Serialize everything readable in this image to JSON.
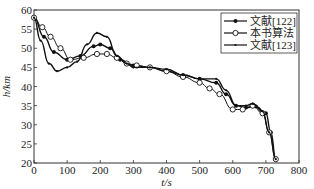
{
  "chart_data": {
    "type": "line",
    "title": "",
    "xlabel": "t/s",
    "ylabel": "h/km",
    "xlim": [
      0,
      800
    ],
    "ylim": [
      20,
      60
    ],
    "xticks": [
      0,
      100,
      200,
      300,
      400,
      500,
      600,
      700,
      800
    ],
    "yticks": [
      20,
      25,
      30,
      35,
      40,
      45,
      50,
      55,
      60
    ],
    "grid": false,
    "legend_position": "upper right",
    "series": [
      {
        "name": "文献[122]",
        "marker": "filled-dot",
        "x": [
          0,
          30,
          60,
          100,
          140,
          180,
          200,
          230,
          260,
          300,
          350,
          400,
          450,
          500,
          550,
          580,
          610,
          640,
          670,
          700,
          715,
          730
        ],
        "y": [
          58,
          53,
          49,
          47,
          48,
          50.5,
          51,
          50,
          47,
          45.5,
          45,
          44,
          43,
          42,
          41,
          38,
          35,
          34.5,
          34.8,
          33,
          28,
          21
        ]
      },
      {
        "name": "本书算法",
        "marker": "open-circle",
        "x": [
          0,
          25,
          50,
          80,
          110,
          150,
          190,
          220,
          250,
          280,
          310,
          350,
          400,
          450,
          500,
          530,
          560,
          600,
          630,
          660,
          690,
          710,
          730
        ],
        "y": [
          58,
          55.5,
          53,
          50,
          47,
          47.5,
          48.5,
          48.5,
          47.5,
          46,
          45.5,
          45,
          44,
          42.5,
          41,
          39.5,
          38,
          34,
          34,
          35,
          33,
          28,
          21
        ]
      },
      {
        "name": "文献[123]",
        "marker": "small-dot",
        "x": [
          0,
          20,
          45,
          70,
          100,
          130,
          160,
          190,
          220,
          250,
          280,
          300,
          350,
          400,
          450,
          500,
          550,
          580,
          610,
          640,
          660,
          690,
          710,
          730
        ],
        "y": [
          58,
          52,
          46,
          44,
          45,
          46.5,
          51,
          54,
          53,
          48,
          46,
          45,
          45,
          44.5,
          43,
          42,
          42,
          39,
          35,
          35,
          35.5,
          33.5,
          28,
          21
        ]
      }
    ]
  }
}
